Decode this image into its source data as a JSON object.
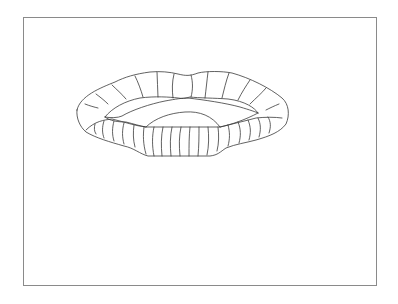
{
  "canvas": {
    "background": "#ffffff",
    "frame_border_color": "#8a8a8a",
    "stroke_color": "#3a3a3a"
  },
  "drawing": {
    "subject": "lips-line-drawing",
    "style": "outline sketch with contour hatching"
  }
}
